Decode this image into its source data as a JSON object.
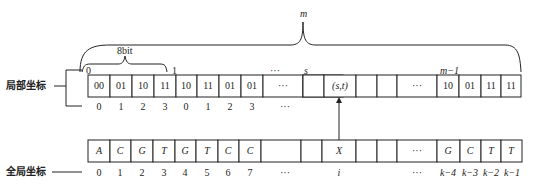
{
  "labels": {
    "local": "局部坐标",
    "global": "全局坐标",
    "m": "m",
    "bit8": "8bit",
    "tick0": "0",
    "tick1": "1",
    "tick_dots": "···",
    "tick_s": "s",
    "tick_m1": "m−1"
  },
  "local_row": {
    "cells": [
      "00",
      "01",
      "10",
      "11",
      "10",
      "11",
      "01",
      "01",
      "",
      "···",
      "",
      "(s,t)",
      "",
      "",
      "···",
      "10",
      "01",
      "11",
      "11"
    ],
    "indices": [
      "0",
      "1",
      "2",
      "3",
      "0",
      "1",
      "2",
      "3",
      "",
      "···",
      "",
      "",
      "",
      "",
      "",
      "",
      "",
      "",
      ""
    ]
  },
  "global_row": {
    "cells": [
      "A",
      "C",
      "G",
      "T",
      "G",
      "T",
      "C",
      "C",
      "",
      "",
      "",
      "X",
      "",
      "",
      "···",
      "G",
      "C",
      "T",
      "T"
    ],
    "indices": [
      "0",
      "1",
      "2",
      "3",
      "4",
      "5",
      "6",
      "7",
      "···",
      "",
      "",
      "i",
      "",
      "",
      "···",
      "k−4",
      "k−3",
      "k−2",
      "k−1"
    ]
  }
}
